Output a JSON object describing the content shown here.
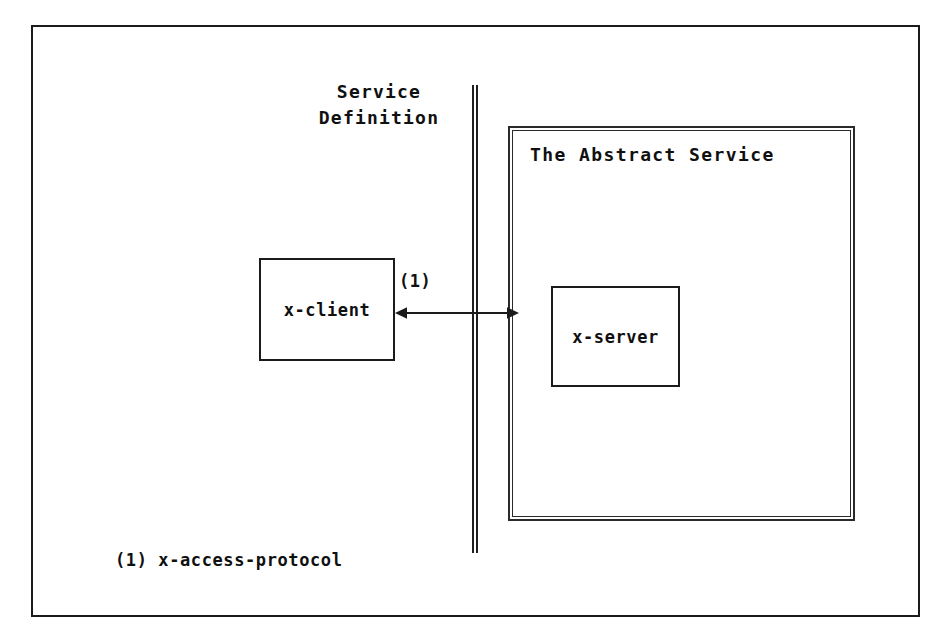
{
  "figure": {
    "kind": "abstract-service-diagram",
    "background_color": "#ffffff",
    "ink_color": "#101010",
    "frame": {
      "label": "figure-frame",
      "x": 31,
      "y": 25,
      "width": 889,
      "height": 592
    }
  },
  "boundary": {
    "name": "service-definition-boundary",
    "style": "double-vertical-line",
    "caption": "Service\nDefinition",
    "caption_line_1": "Service",
    "caption_line_2": "Definition"
  },
  "regions": [
    {
      "id": "abstract-service",
      "title": "The Abstract Service",
      "border_style": "double-rectangle"
    }
  ],
  "entities": [
    {
      "id": "x-client",
      "label": "x-client",
      "side": "left-of-boundary"
    },
    {
      "id": "x-server",
      "label": "x-server",
      "side": "inside-abstract-service"
    }
  ],
  "connections": [
    {
      "id": "x-access-protocol-link",
      "ref": "(1)",
      "from": "x-client",
      "to": "x-server",
      "direction": "bidirectional",
      "crosses": "service-definition-boundary"
    }
  ],
  "legend": {
    "entries": [
      {
        "ref": "(1)",
        "text": "x-access-protocol",
        "full": "(1) x-access-protocol"
      }
    ]
  }
}
